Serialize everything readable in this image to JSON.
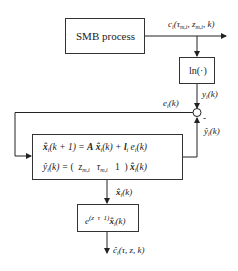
{
  "diagram": {
    "type": "block-diagram",
    "blocks": {
      "smb_process": {
        "label": "SMB process"
      },
      "log_block": {
        "label": "ln(·)"
      },
      "observer": {
        "eq1": "x̂ᵢ(k+1) = A x̂ᵢ(k) + lᵢ eᵢ(k)",
        "eq2": "ŷᵢ(k) = ( z_m,i  τ_m,i  1 ) x̂ᵢ(k)"
      },
      "exp_block": {
        "label": "e^(z τ 1) x̂ᵢ(k)"
      }
    },
    "signals": {
      "process_output": "cᵢ(τ_m,i, z_m,i, k)",
      "log_output": "yᵢ(k)",
      "error": "eᵢ(k)",
      "minus_sign": "-",
      "estimate_output": "ŷᵢ(k)",
      "state_estimate": "x̂ᵢ(k)",
      "final_output": "ĉᵢ(τ, z, k)"
    },
    "summing_junction": {
      "symbol": "circle"
    }
  },
  "text": {
    "smb": "SMB process",
    "ln": "ln(·)",
    "minus": "-"
  }
}
